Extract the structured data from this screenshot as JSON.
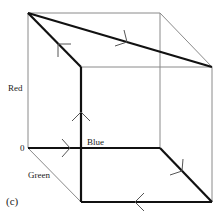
{
  "figure": {
    "panel_label": "(c)",
    "axes": {
      "red": "Red",
      "blue": "Blue",
      "green": "Green",
      "origin": "0"
    },
    "colors": {
      "thin_edge": "#888888",
      "thick_path": "#111111"
    },
    "vertices": {
      "origin": [
        28,
        148
      ],
      "red_top": [
        28,
        13
      ],
      "blue_end": [
        160,
        148
      ],
      "back_top_right": [
        160,
        13
      ],
      "front_top_left": [
        81,
        67
      ],
      "front_top_right": [
        212,
        67
      ],
      "front_bottom_left": [
        81,
        202
      ],
      "front_bottom_right": [
        212,
        202
      ]
    },
    "path_description": "Closed path: 0 → Blue → front-bottom-right → front-bottom-left → front-top-left → red-top → front-top-right (with arrows)"
  }
}
